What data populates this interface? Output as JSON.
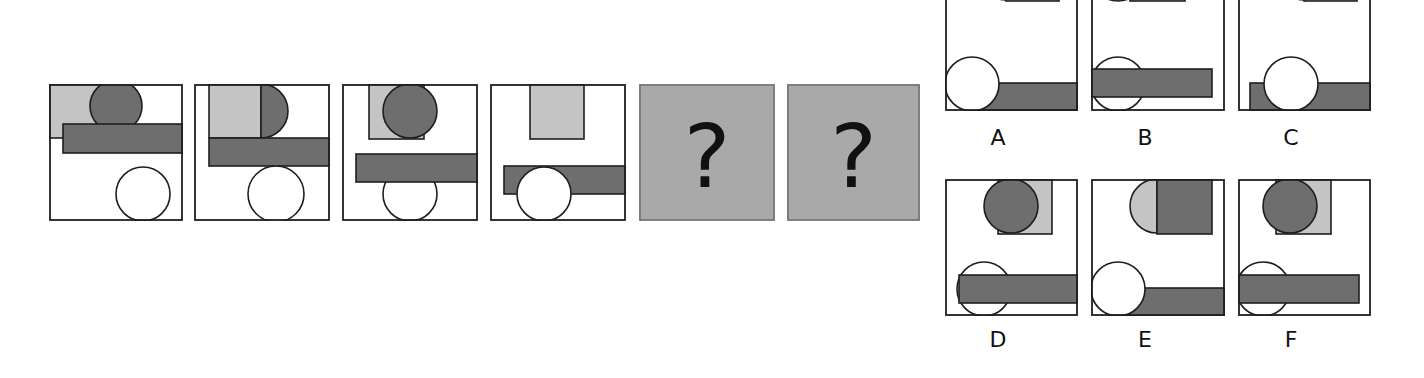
{
  "colors": {
    "light": "#c4c4c4",
    "dark": "#6e6e6e",
    "white": "#ffffff",
    "stroke": "#1e1e1e",
    "unknown_bg": "#a9a9a9"
  },
  "sequence": [
    {
      "id": "1",
      "x": 49,
      "y": 84,
      "w": 134,
      "h": 137,
      "shapes": [
        {
          "kind": "rect",
          "fill": "light",
          "x": 0,
          "y": 0,
          "w": 54,
          "h": 54
        },
        {
          "kind": "circle",
          "fill": "dark",
          "cx": 67,
          "cy": 22,
          "r": 26
        },
        {
          "kind": "rect",
          "fill": "dark",
          "x": 14,
          "y": 40,
          "w": 120,
          "h": 29
        },
        {
          "kind": "circle",
          "fill": "white",
          "cx": 94,
          "cy": 110,
          "r": 27
        }
      ]
    },
    {
      "id": "2",
      "x": 194,
      "y": 84,
      "w": 136,
      "h": 137,
      "shapes": [
        {
          "kind": "rect",
          "fill": "light",
          "x": 15,
          "y": 0,
          "w": 52,
          "h": 54
        },
        {
          "kind": "halfcircle-right",
          "fill": "dark",
          "cx": 67,
          "cy": 27,
          "r": 27
        },
        {
          "kind": "rect",
          "fill": "dark",
          "x": 15,
          "y": 54,
          "w": 121,
          "h": 28
        },
        {
          "kind": "circle",
          "fill": "white",
          "cx": 82,
          "cy": 110,
          "r": 28
        }
      ]
    },
    {
      "id": "3",
      "x": 342,
      "y": 84,
      "w": 136,
      "h": 137,
      "shapes": [
        {
          "kind": "rect",
          "fill": "light",
          "x": 27,
          "y": 0,
          "w": 55,
          "h": 55
        },
        {
          "kind": "circle",
          "fill": "dark",
          "cx": 68,
          "cy": 27,
          "r": 27
        },
        {
          "kind": "circle",
          "fill": "white",
          "cx": 68,
          "cy": 110,
          "r": 27
        },
        {
          "kind": "rect",
          "fill": "dark",
          "x": 14,
          "y": 70,
          "w": 122,
          "h": 28
        }
      ]
    },
    {
      "id": "4",
      "x": 490,
      "y": 84,
      "w": 136,
      "h": 137,
      "shapes": [
        {
          "kind": "rect",
          "fill": "light",
          "x": 40,
          "y": 0,
          "w": 54,
          "h": 55
        },
        {
          "kind": "rect",
          "fill": "dark",
          "x": 14,
          "y": 82,
          "w": 122,
          "h": 28
        },
        {
          "kind": "circle",
          "fill": "white",
          "cx": 54,
          "cy": 110,
          "r": 27
        }
      ]
    }
  ],
  "unknowns": [
    {
      "id": "q1",
      "x": 639,
      "y": 84,
      "w": 136,
      "h": 137,
      "symbol": "?"
    },
    {
      "id": "q2",
      "x": 787,
      "y": 84,
      "w": 133,
      "h": 137,
      "symbol": "?"
    }
  ],
  "options": [
    {
      "label": "A",
      "x": 945,
      "y": -26,
      "w": 133,
      "h": 137,
      "label_x": 981,
      "label_y": 126,
      "shapes": [
        {
          "kind": "halfcircle-left",
          "fill": "dark",
          "cx": 61,
          "cy": 0,
          "r": 26
        },
        {
          "kind": "rect",
          "fill": "light",
          "x": 61,
          "y": -26,
          "w": 53,
          "h": 53
        },
        {
          "kind": "rect",
          "fill": "dark",
          "x": 27,
          "y": 109,
          "w": 106,
          "h": 28
        },
        {
          "kind": "circle",
          "fill": "white",
          "cx": 27,
          "cy": 110,
          "r": 27
        }
      ]
    },
    {
      "label": "B",
      "x": 1091,
      "y": -26,
      "w": 134,
      "h": 137,
      "label_x": 1128,
      "label_y": 126,
      "shapes": [
        {
          "kind": "rect",
          "fill": "light",
          "x": 39,
          "y": -26,
          "w": 55,
          "h": 53
        },
        {
          "kind": "circle",
          "fill": "dark",
          "cx": 27,
          "cy": 0,
          "r": 27
        },
        {
          "kind": "circle",
          "fill": "white",
          "cx": 27,
          "cy": 110,
          "r": 27
        },
        {
          "kind": "rect",
          "fill": "dark",
          "x": 0,
          "y": 95,
          "w": 121,
          "h": 28
        }
      ]
    },
    {
      "label": "C",
      "x": 1238,
      "y": -26,
      "w": 133,
      "h": 137,
      "label_x": 1274,
      "label_y": 126,
      "shapes": [
        {
          "kind": "halfcircle-left",
          "fill": "dark",
          "cx": 66,
          "cy": 0,
          "r": 26
        },
        {
          "kind": "rect",
          "fill": "light",
          "x": 66,
          "y": -26,
          "w": 53,
          "h": 53
        },
        {
          "kind": "rect",
          "fill": "dark",
          "x": 12,
          "y": 109,
          "w": 121,
          "h": 28
        },
        {
          "kind": "circle",
          "fill": "white",
          "cx": 53,
          "cy": 110,
          "r": 27
        }
      ]
    },
    {
      "label": "D",
      "x": 945,
      "y": 179,
      "w": 133,
      "h": 137,
      "label_x": 981,
      "label_y": 328,
      "shapes": [
        {
          "kind": "rect",
          "fill": "light",
          "x": 53,
          "y": 0,
          "w": 54,
          "h": 55
        },
        {
          "kind": "circle",
          "fill": "dark",
          "cx": 66,
          "cy": 27,
          "r": 27
        },
        {
          "kind": "circle",
          "fill": "white",
          "cx": 39,
          "cy": 110,
          "r": 27
        },
        {
          "kind": "rect",
          "fill": "dark",
          "x": 14,
          "y": 96,
          "w": 119,
          "h": 28
        }
      ]
    },
    {
      "label": "E",
      "x": 1091,
      "y": 179,
      "w": 134,
      "h": 137,
      "label_x": 1128,
      "label_y": 328,
      "shapes": [
        {
          "kind": "halfcircle-left",
          "fill": "light",
          "cx": 66,
          "cy": 27,
          "r": 27
        },
        {
          "kind": "rect",
          "fill": "dark",
          "x": 66,
          "y": 0,
          "w": 55,
          "h": 55
        },
        {
          "kind": "rect",
          "fill": "dark",
          "x": 27,
          "y": 109,
          "w": 107,
          "h": 28
        },
        {
          "kind": "circle",
          "fill": "white",
          "cx": 27,
          "cy": 110,
          "r": 27
        }
      ]
    },
    {
      "label": "F",
      "x": 1238,
      "y": 179,
      "w": 133,
      "h": 137,
      "label_x": 1274,
      "label_y": 328,
      "shapes": [
        {
          "kind": "rect",
          "fill": "light",
          "x": 38,
          "y": 0,
          "w": 55,
          "h": 55
        },
        {
          "kind": "circle",
          "fill": "dark",
          "cx": 52,
          "cy": 27,
          "r": 27
        },
        {
          "kind": "circle",
          "fill": "white",
          "cx": 25,
          "cy": 110,
          "r": 27
        },
        {
          "kind": "rect",
          "fill": "dark",
          "x": 0,
          "y": 96,
          "w": 121,
          "h": 28
        }
      ]
    }
  ]
}
